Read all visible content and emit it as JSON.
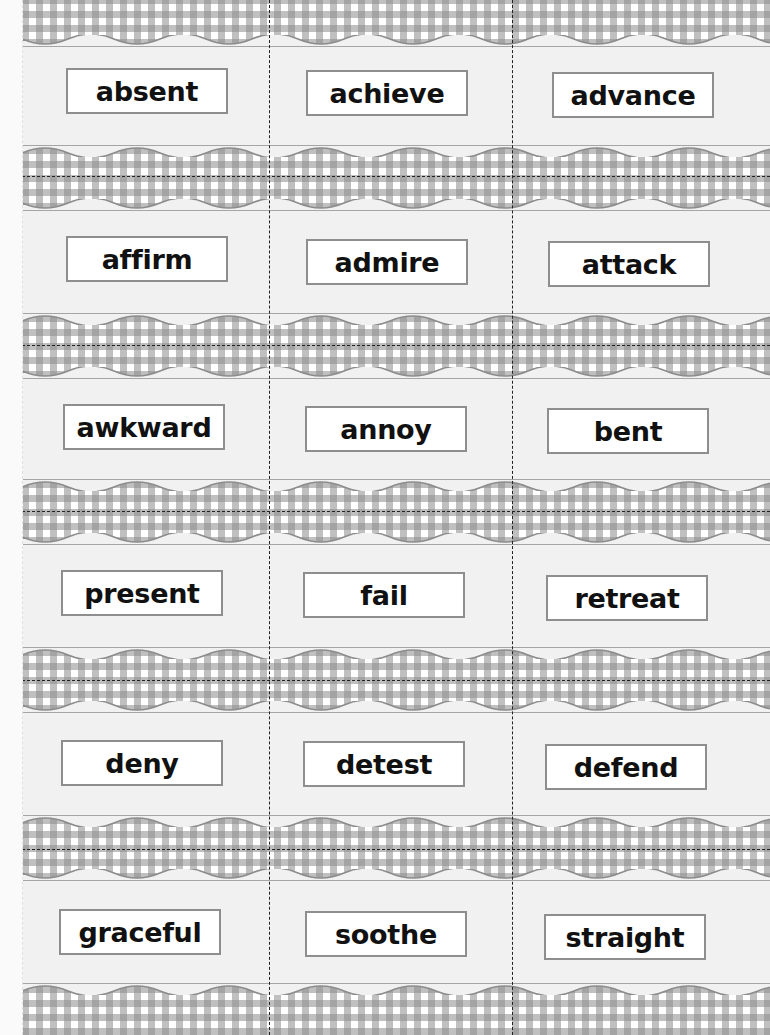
{
  "sheet": {
    "background_color": "#f1f1f1",
    "gingham_color": "#8c8c8c",
    "card_border_color": "#8e8e8e",
    "rows": [
      {
        "words": [
          "absent",
          "achieve",
          "advance"
        ]
      },
      {
        "words": [
          "affirm",
          "admire",
          "attack"
        ]
      },
      {
        "words": [
          "awkward",
          "annoy",
          "bent"
        ]
      },
      {
        "words": [
          "present",
          "fail",
          "retreat"
        ]
      },
      {
        "words": [
          "deny",
          "detest",
          "defend"
        ]
      },
      {
        "words": [
          "graceful",
          "soothe",
          "straight"
        ]
      }
    ]
  }
}
